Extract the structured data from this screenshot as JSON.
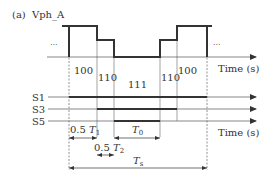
{
  "figure": {
    "panel_label": "(a)",
    "signal_name": "Vph_A",
    "ellipsis_left": "...",
    "ellipsis_right": "...",
    "time_axis_label_top": "Time (s)",
    "time_axis_label_bottom": "Time (s)",
    "states": [
      "100",
      "110",
      "111",
      "110",
      "100"
    ],
    "switch_labels": [
      "S1",
      "S3",
      "S5"
    ],
    "intervals": {
      "half_t1": {
        "prefix": "0.5 ",
        "symbol": "T",
        "subscript": "1"
      },
      "half_t2": {
        "prefix": "0.5 ",
        "symbol": "T",
        "subscript": "2"
      },
      "t0": {
        "symbol": "T",
        "subscript": "0"
      },
      "ts": {
        "symbol": "T",
        "subscript": "s"
      }
    }
  },
  "colors": {
    "line": "#333333",
    "thin_line": "#555555",
    "dashed": "#777777",
    "text": "#333333"
  }
}
